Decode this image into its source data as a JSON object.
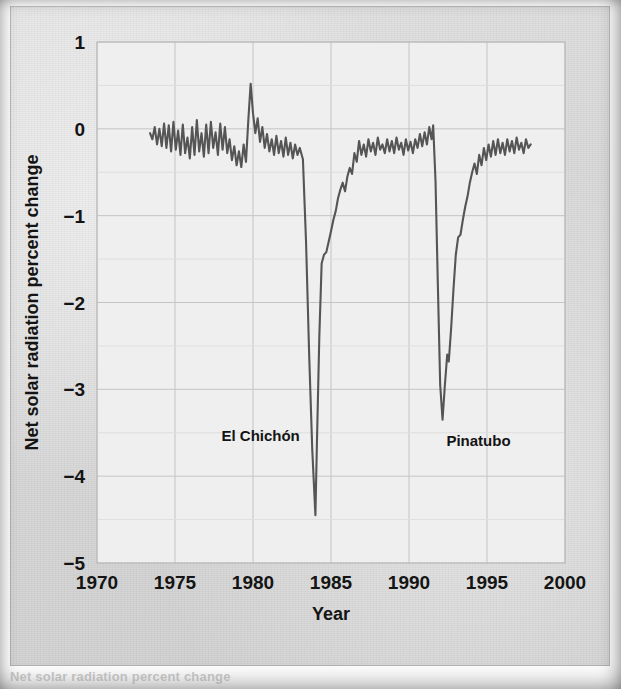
{
  "figure": {
    "background_color": "#d9d9d9",
    "plot_background_color": "#efefef",
    "line_color": "#555555",
    "grid_color": "#c4c4c4",
    "text_color": "#141414",
    "partial_caption": "Net solar radiation percent change"
  },
  "chart_data": {
    "type": "line",
    "title": "",
    "xlabel": "Year",
    "ylabel": "Net solar radiation percent change",
    "xlim": [
      1970,
      2000
    ],
    "ylim": [
      -5,
      1
    ],
    "xticks": [
      1970,
      1975,
      1980,
      1985,
      1990,
      1995,
      2000
    ],
    "xtick_labels": [
      "1970",
      "1975",
      "1980",
      "1985",
      "1990",
      "1995",
      "2000"
    ],
    "yticks": [
      1,
      0,
      -1,
      -2,
      -3,
      -4,
      -5
    ],
    "ytick_labels": [
      "1",
      "0",
      "−1",
      "−2",
      "−3",
      "−4",
      "−5"
    ],
    "grid": true,
    "legend": "none",
    "annotations": [
      {
        "text": "El Chichón",
        "x": 1983.0,
        "y": -3.6,
        "anchor": "end"
      },
      {
        "text": "Pinatubo",
        "x": 1992.4,
        "y": -3.65,
        "anchor": "start"
      }
    ],
    "series": [
      {
        "name": "Net solar radiation percent change",
        "color": "#555555",
        "x": [
          1973.4,
          1973.55,
          1973.7,
          1973.85,
          1974.0,
          1974.15,
          1974.3,
          1974.45,
          1974.6,
          1974.75,
          1974.9,
          1975.05,
          1975.2,
          1975.35,
          1975.5,
          1975.65,
          1975.8,
          1975.95,
          1976.1,
          1976.25,
          1976.4,
          1976.55,
          1976.7,
          1976.85,
          1977.0,
          1977.15,
          1977.3,
          1977.45,
          1977.6,
          1977.75,
          1977.9,
          1978.05,
          1978.2,
          1978.35,
          1978.5,
          1978.65,
          1978.8,
          1978.95,
          1979.1,
          1979.25,
          1979.4,
          1979.55,
          1979.7,
          1979.85,
          1980.0,
          1980.15,
          1980.3,
          1980.45,
          1980.6,
          1980.75,
          1980.9,
          1981.05,
          1981.2,
          1981.35,
          1981.5,
          1981.65,
          1981.8,
          1981.95,
          1982.1,
          1982.25,
          1982.4,
          1982.55,
          1982.7,
          1982.85,
          1983.0,
          1983.2,
          1983.4,
          1983.6,
          1983.8,
          1984.0,
          1984.1,
          1984.25,
          1984.4,
          1984.55,
          1984.7,
          1984.85,
          1985.0,
          1985.15,
          1985.3,
          1985.45,
          1985.6,
          1985.75,
          1985.9,
          1986.05,
          1986.2,
          1986.35,
          1986.5,
          1986.65,
          1986.8,
          1986.95,
          1987.1,
          1987.25,
          1987.4,
          1987.55,
          1987.7,
          1987.85,
          1988.0,
          1988.15,
          1988.3,
          1988.45,
          1988.6,
          1988.75,
          1988.9,
          1989.05,
          1989.2,
          1989.35,
          1989.5,
          1989.65,
          1989.8,
          1989.95,
          1990.1,
          1990.25,
          1990.4,
          1990.55,
          1990.7,
          1990.85,
          1991.0,
          1991.15,
          1991.3,
          1991.45,
          1991.55,
          1991.7,
          1991.85,
          1992.0,
          1992.15,
          1992.3,
          1992.45,
          1992.55,
          1992.7,
          1992.85,
          1993.0,
          1993.15,
          1993.3,
          1993.45,
          1993.6,
          1993.75,
          1993.9,
          1994.05,
          1994.2,
          1994.35,
          1994.5,
          1994.65,
          1994.8,
          1994.95,
          1995.1,
          1995.25,
          1995.4,
          1995.55,
          1995.7,
          1995.85,
          1996.0,
          1996.15,
          1996.3,
          1996.45,
          1996.6,
          1996.75,
          1996.9,
          1997.05,
          1997.2,
          1997.35,
          1997.5,
          1997.65,
          1997.8
        ],
        "y": [
          -0.05,
          -0.12,
          0.02,
          -0.18,
          0.0,
          -0.2,
          0.06,
          -0.22,
          0.04,
          -0.26,
          0.08,
          -0.24,
          -0.02,
          -0.3,
          0.05,
          -0.28,
          -0.1,
          -0.34,
          0.02,
          -0.3,
          0.1,
          -0.26,
          -0.05,
          -0.32,
          0.05,
          -0.28,
          0.08,
          -0.22,
          -0.04,
          -0.3,
          0.06,
          -0.24,
          0.02,
          -0.28,
          -0.12,
          -0.36,
          -0.2,
          -0.42,
          -0.26,
          -0.44,
          -0.18,
          -0.38,
          0.1,
          0.52,
          0.18,
          -0.05,
          0.12,
          -0.15,
          0.02,
          -0.22,
          -0.06,
          -0.26,
          -0.12,
          -0.3,
          -0.08,
          -0.28,
          -0.14,
          -0.32,
          -0.1,
          -0.3,
          -0.16,
          -0.34,
          -0.18,
          -0.3,
          -0.22,
          -0.35,
          -1.3,
          -2.6,
          -3.7,
          -4.45,
          -3.6,
          -2.4,
          -1.55,
          -1.45,
          -1.42,
          -1.3,
          -1.18,
          -1.05,
          -0.95,
          -0.8,
          -0.7,
          -0.62,
          -0.72,
          -0.55,
          -0.45,
          -0.52,
          -0.28,
          -0.38,
          -0.14,
          -0.3,
          -0.18,
          -0.32,
          -0.12,
          -0.26,
          -0.16,
          -0.3,
          -0.1,
          -0.24,
          -0.18,
          -0.28,
          -0.12,
          -0.26,
          -0.14,
          -0.28,
          -0.1,
          -0.24,
          -0.16,
          -0.3,
          -0.12,
          -0.25,
          -0.15,
          -0.28,
          -0.12,
          -0.22,
          -0.06,
          -0.2,
          -0.04,
          -0.18,
          0.02,
          -0.12,
          0.04,
          -0.6,
          -1.8,
          -2.95,
          -3.35,
          -2.95,
          -2.6,
          -2.68,
          -2.3,
          -1.85,
          -1.45,
          -1.25,
          -1.22,
          -1.05,
          -0.9,
          -0.78,
          -0.62,
          -0.5,
          -0.4,
          -0.52,
          -0.3,
          -0.42,
          -0.22,
          -0.36,
          -0.18,
          -0.32,
          -0.14,
          -0.3,
          -0.12,
          -0.28,
          -0.16,
          -0.3,
          -0.12,
          -0.26,
          -0.14,
          -0.28,
          -0.1,
          -0.24,
          -0.16,
          -0.28,
          -0.12,
          -0.22,
          -0.18
        ]
      }
    ]
  }
}
